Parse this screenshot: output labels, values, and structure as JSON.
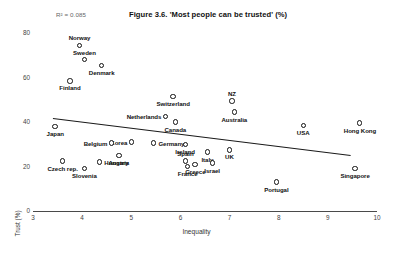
{
  "chart_data": {
    "type": "scatter",
    "title": "Figure 3.6. 'Most people can be trusted' (%)",
    "xlabel": "Inequality",
    "ylabel": "Trust (%)",
    "xlim": [
      3,
      10
    ],
    "ylim": [
      0,
      80
    ],
    "xticks": [
      "3",
      "4",
      "5",
      "6",
      "7",
      "8",
      "9",
      "10"
    ],
    "xtick_values": [
      3,
      4,
      5,
      6,
      7,
      8,
      9,
      10
    ],
    "yticks": [
      "0",
      "20",
      "40",
      "60",
      "80"
    ],
    "ytick_values": [
      0,
      20,
      40,
      60,
      80
    ],
    "grid": false,
    "legend": null,
    "annotation": "R² = 0.085",
    "trendline": {
      "x_start": 3.4,
      "y_start": 41.8,
      "x_end": 9.45,
      "y_end": 25.2
    },
    "points": [
      {
        "label": "Norway",
        "x": 3.95,
        "y": 74.5,
        "label_pos": "above"
      },
      {
        "label": "Sweden",
        "x": 4.05,
        "y": 68.0,
        "label_pos": "above"
      },
      {
        "label": "Denmark",
        "x": 4.4,
        "y": 65.5,
        "label_pos": "below"
      },
      {
        "label": "Finland",
        "x": 3.75,
        "y": 58.5,
        "label_pos": "below"
      },
      {
        "label": "Switzerland",
        "x": 5.85,
        "y": 51.5,
        "label_pos": "below"
      },
      {
        "label": "NZ",
        "x": 7.05,
        "y": 49.5,
        "label_pos": "above"
      },
      {
        "label": "Australia",
        "x": 7.1,
        "y": 44.5,
        "label_pos": "below"
      },
      {
        "label": "Netherlands",
        "x": 5.7,
        "y": 42.5,
        "label_pos": "left"
      },
      {
        "label": "Canada",
        "x": 5.9,
        "y": 40.0,
        "label_pos": "below"
      },
      {
        "label": "USA",
        "x": 8.5,
        "y": 38.5,
        "label_pos": "below"
      },
      {
        "label": "Hong Kong",
        "x": 9.65,
        "y": 39.5,
        "label_pos": "below"
      },
      {
        "label": "Japan",
        "x": 3.45,
        "y": 38.0,
        "label_pos": "below"
      },
      {
        "label": "Korea",
        "x": 5.0,
        "y": 31.0,
        "label_pos": "left"
      },
      {
        "label": "Germany",
        "x": 5.45,
        "y": 30.5,
        "label_pos": "right"
      },
      {
        "label": "Ireland",
        "x": 6.1,
        "y": 30.0,
        "label_pos": "below"
      },
      {
        "label": "Belgium",
        "x": 4.6,
        "y": 30.5,
        "label_pos": "left"
      },
      {
        "label": "Italy",
        "x": 6.55,
        "y": 26.5,
        "label_pos": "below"
      },
      {
        "label": "UK",
        "x": 7.0,
        "y": 27.5,
        "label_pos": "below"
      },
      {
        "label": "Austria",
        "x": 4.75,
        "y": 25.0,
        "label_pos": "below"
      },
      {
        "label": "Hungary",
        "x": 4.35,
        "y": 22.0,
        "label_pos": "right"
      },
      {
        "label": "Czech rep.",
        "x": 3.6,
        "y": 22.5,
        "label_pos": "below"
      },
      {
        "label": "Spain",
        "x": 6.1,
        "y": 22.5,
        "label_pos": "above"
      },
      {
        "label": "Greece",
        "x": 6.3,
        "y": 21.0,
        "label_pos": "below"
      },
      {
        "label": "Israel",
        "x": 6.65,
        "y": 21.5,
        "label_pos": "below"
      },
      {
        "label": "France",
        "x": 6.15,
        "y": 20.0,
        "label_pos": "below"
      },
      {
        "label": "Slovenia",
        "x": 4.05,
        "y": 19.0,
        "label_pos": "below"
      },
      {
        "label": "Singapore",
        "x": 9.55,
        "y": 19.0,
        "label_pos": "below"
      },
      {
        "label": "Portugal",
        "x": 7.95,
        "y": 13.0,
        "label_pos": "below"
      }
    ]
  }
}
